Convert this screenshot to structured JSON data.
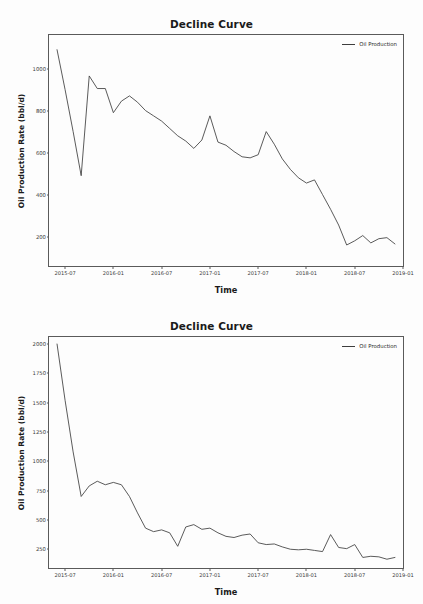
{
  "figures": [
    {
      "id": "top",
      "title": "Decline Curve",
      "xlabel": "Time",
      "ylabel": "Oil Production Rate (bbl/d)",
      "legend_label": "Oil Production",
      "line_color": "#3d3d3d"
    },
    {
      "id": "bottom",
      "title": "Decline Curve",
      "xlabel": "Time",
      "ylabel": "Oil Production Rate (bbl/d)",
      "legend_label": "Oil Production",
      "line_color": "#3d3d3d"
    }
  ],
  "chart_data": [
    {
      "type": "line",
      "title": "Decline Curve",
      "xlabel": "Time",
      "ylabel": "Oil Production Rate (bbl/d)",
      "legend": [
        "Oil Production"
      ],
      "legend_position": "upper right",
      "grid": false,
      "xtick_labels": [
        "2015-07",
        "2016-01",
        "2016-07",
        "2017-01",
        "2017-07",
        "2018-01",
        "2018-07",
        "2019-01"
      ],
      "ytick_labels": [
        "200",
        "400",
        "600",
        "800",
        "1000"
      ],
      "ylim": [
        60,
        1160
      ],
      "xlim": [
        "2015-05",
        "2019-01"
      ],
      "x": [
        "2015-06",
        "2015-07",
        "2015-08",
        "2015-09",
        "2015-10",
        "2015-11",
        "2015-12",
        "2016-01",
        "2016-02",
        "2016-03",
        "2016-04",
        "2016-05",
        "2016-06",
        "2016-07",
        "2016-08",
        "2016-09",
        "2016-10",
        "2016-11",
        "2016-12",
        "2017-01",
        "2017-02",
        "2017-03",
        "2017-04",
        "2017-05",
        "2017-06",
        "2017-07",
        "2017-08",
        "2017-09",
        "2017-10",
        "2017-11",
        "2017-12",
        "2018-01",
        "2018-02",
        "2018-03",
        "2018-04",
        "2018-05",
        "2018-06",
        "2018-07",
        "2018-08",
        "2018-09",
        "2018-10",
        "2018-11",
        "2018-12"
      ],
      "series": [
        {
          "name": "Oil Production",
          "values": [
            1090,
            900,
            700,
            490,
            965,
            905,
            905,
            790,
            845,
            870,
            840,
            800,
            775,
            750,
            715,
            680,
            655,
            620,
            660,
            775,
            650,
            635,
            605,
            580,
            575,
            590,
            700,
            640,
            570,
            520,
            480,
            455,
            470,
            400,
            330,
            255,
            160,
            180,
            205,
            170,
            190,
            195,
            165
          ]
        }
      ]
    },
    {
      "type": "line",
      "title": "Decline Curve",
      "xlabel": "Time",
      "ylabel": "Oil Production Rate (bbl/d)",
      "legend": [
        "Oil Production"
      ],
      "legend_position": "upper right",
      "grid": false,
      "xtick_labels": [
        "2015-07",
        "2016-01",
        "2016-07",
        "2017-01",
        "2017-07",
        "2018-01",
        "2018-07",
        "2019-01"
      ],
      "ytick_labels": [
        "250",
        "500",
        "750",
        "1000",
        "1250",
        "1500",
        "1750",
        "2000"
      ],
      "ylim": [
        90,
        2060
      ],
      "xlim": [
        "2015-05",
        "2019-01"
      ],
      "x": [
        "2015-06",
        "2015-07",
        "2015-08",
        "2015-09",
        "2015-10",
        "2015-11",
        "2015-12",
        "2016-01",
        "2016-02",
        "2016-03",
        "2016-04",
        "2016-05",
        "2016-06",
        "2016-07",
        "2016-08",
        "2016-09",
        "2016-10",
        "2016-11",
        "2016-12",
        "2017-01",
        "2017-02",
        "2017-03",
        "2017-04",
        "2017-05",
        "2017-06",
        "2017-07",
        "2017-08",
        "2017-09",
        "2017-10",
        "2017-11",
        "2017-12",
        "2018-01",
        "2018-02",
        "2018-03",
        "2018-04",
        "2018-05",
        "2018-06",
        "2018-07",
        "2018-08",
        "2018-09",
        "2018-10",
        "2018-11",
        "2018-12"
      ],
      "series": [
        {
          "name": "Oil Production",
          "values": [
            2000,
            1520,
            1080,
            700,
            790,
            830,
            800,
            820,
            800,
            700,
            560,
            430,
            400,
            415,
            390,
            275,
            440,
            460,
            420,
            430,
            390,
            360,
            350,
            370,
            380,
            305,
            290,
            295,
            270,
            250,
            245,
            250,
            240,
            230,
            375,
            265,
            255,
            290,
            180,
            190,
            185,
            165,
            180
          ]
        }
      ]
    }
  ]
}
